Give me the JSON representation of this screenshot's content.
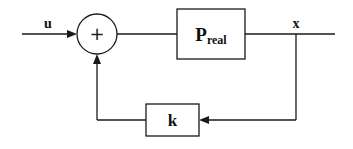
{
  "diagram": {
    "type": "feedback-control-block-diagram",
    "signals": {
      "input": "u",
      "output": "x"
    },
    "summing_junction": {
      "sign": "+"
    },
    "blocks": {
      "plant": {
        "label_main": "P",
        "label_sub": "real"
      },
      "feedback_gain": {
        "label": "k"
      }
    },
    "colors": {
      "stroke": "#1a1a1a",
      "background": "#ffffff"
    }
  }
}
